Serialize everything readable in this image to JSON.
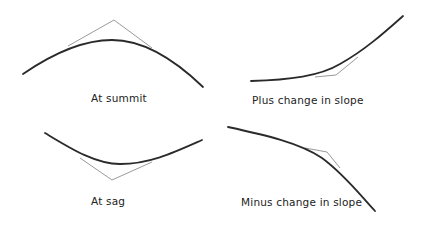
{
  "figure": {
    "panels": [
      {
        "id": "summit",
        "label": "At summit"
      },
      {
        "id": "plus",
        "label": "Plus change in slope"
      },
      {
        "id": "sag",
        "label": "At sag"
      },
      {
        "id": "minus",
        "label": "Minus change in slope"
      }
    ],
    "colors": {
      "curve": "#2a2a2a",
      "tangent": "#9a9a9a",
      "background": "#ffffff"
    }
  }
}
